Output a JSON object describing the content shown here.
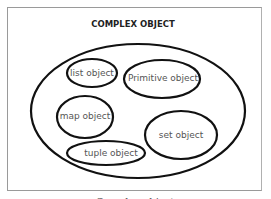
{
  "diagram": {
    "title": "COMPLEX OBJECT",
    "nodes": [
      {
        "id": "list",
        "label": "list object"
      },
      {
        "id": "primitive",
        "label": "Primitive object"
      },
      {
        "id": "map",
        "label": "map object"
      },
      {
        "id": "set",
        "label": "set object"
      },
      {
        "id": "tuple",
        "label": "tuple object"
      }
    ],
    "caption": "Complex object"
  }
}
